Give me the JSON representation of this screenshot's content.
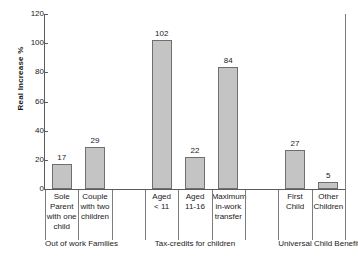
{
  "chart_data": {
    "type": "bar",
    "title": "",
    "xlabel": "",
    "ylabel": "Real Increase %",
    "ylim": [
      0,
      120
    ],
    "yticks": [
      0,
      20,
      40,
      60,
      80,
      100,
      120
    ],
    "grid": false,
    "legend": null,
    "categories": [
      "Sole Parent with one child",
      "Couple with two children",
      "Aged < 11",
      "Aged 11-16",
      "Maximum in-work transfer",
      "First Child",
      "Other Children"
    ],
    "values": [
      17,
      29,
      102,
      22,
      84,
      27,
      5
    ],
    "groups": [
      {
        "label": "Out of work Families",
        "bars": [
          {
            "label_lines": [
              "Sole",
              "Parent",
              "with one",
              "child"
            ],
            "value": 17
          },
          {
            "label_lines": [
              "Couple",
              "with two",
              "children"
            ],
            "value": 29
          }
        ]
      },
      {
        "label": "Tax-credits for children",
        "bars": [
          {
            "label_lines": [
              "Aged",
              "< 11"
            ],
            "value": 102
          },
          {
            "label_lines": [
              "Aged",
              "11-16"
            ],
            "value": 22
          },
          {
            "label_lines": [
              "Maximum",
              "in-work",
              "transfer"
            ],
            "value": 84
          }
        ]
      },
      {
        "label": "Universal Child Benefit",
        "bars": [
          {
            "label_lines": [
              "First",
              "Child"
            ],
            "value": 27
          },
          {
            "label_lines": [
              "Other",
              "Children"
            ],
            "value": 5
          }
        ]
      }
    ],
    "colors": {
      "bar_fill": "#c4c4c4",
      "bar_stroke": "#6f6f6f",
      "axis": "#5b5b5b",
      "separator": "#7d7d7d",
      "text": "#1a1a1a",
      "background": "#ffffff"
    }
  }
}
